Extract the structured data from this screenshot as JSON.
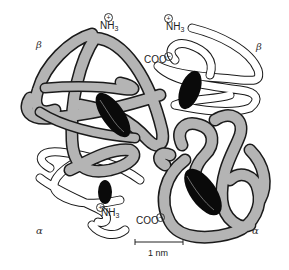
{
  "figure": {
    "subunit_labels": {
      "beta_top_left": "β",
      "beta_top_right": "β",
      "alpha_bottom_left": "α",
      "alpha_bottom_right": "α"
    },
    "terminus_labels": {
      "nh3_top_left": "NH",
      "nh3_top_right": "NH",
      "nh3_bottom": "NH",
      "subscript": "3",
      "coo_top": "COO",
      "coo_bottom": "COO",
      "plus_charge": "+",
      "minus_charge": "−"
    },
    "scale_bar": {
      "label": "1 nm"
    },
    "colors": {
      "shaded_chain": "#b4b4b4",
      "chain_outline": "#1a1a1a",
      "unshaded_chain": "#ffffff",
      "heme": "#0a0a0a"
    }
  }
}
